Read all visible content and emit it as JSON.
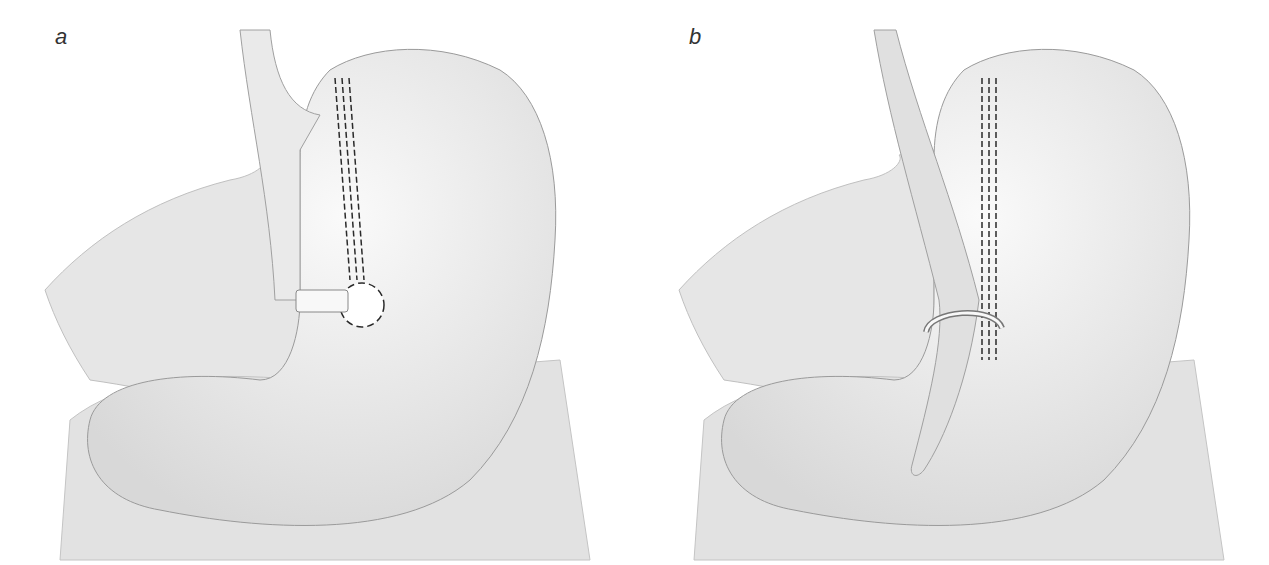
{
  "figure": {
    "panels": [
      {
        "label": "a",
        "depiction": "stomach with vertical staple line ending at circular stapled window and band around outlet"
      },
      {
        "label": "b",
        "depiction": "stomach with vertical staple line along tube and ring around outlet"
      }
    ]
  },
  "colors": {
    "background": "#ffffff",
    "tissue_fill": "#efefef",
    "tissue_shade": "#dcdcdc",
    "outline": "#9a9a9a",
    "staple": "#2a2a2a"
  }
}
